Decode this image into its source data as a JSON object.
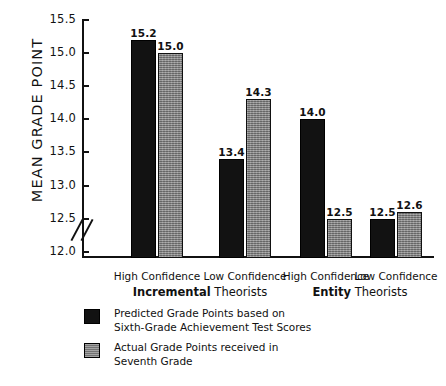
{
  "chart_data": {
    "type": "bar",
    "title": "",
    "xlabel": "",
    "ylabel": "MEAN GRADE POINT",
    "ylim": [
      12.0,
      15.5
    ],
    "ytick_labels": [
      "15.5",
      "15.0",
      "14.5",
      "14.0",
      "13.5",
      "13.0",
      "12.5",
      "12.0"
    ],
    "ytick_values": [
      15.5,
      15.0,
      14.5,
      14.0,
      13.5,
      13.0,
      12.5,
      12.0
    ],
    "axis_break": true,
    "grid": false,
    "legend_position": "bottom-left",
    "categories": [
      "High Confidence",
      "Low Confidence",
      "High Confidence",
      "Low Confidence"
    ],
    "group_labels": [
      {
        "bold": "Incremental",
        "plain": "Theorists"
      },
      {
        "bold": "Entity",
        "plain": "Theorists"
      }
    ],
    "series": [
      {
        "name": "Predicted Grade Points based on Sixth-Grade Achievement Test Scores",
        "color": "#121212",
        "values": [
          15.2,
          13.4,
          14.0,
          12.5
        ],
        "labels": [
          "15.2",
          "13.4",
          "14.0",
          "12.5"
        ]
      },
      {
        "name": "Actual Grade Points received in Seventh Grade",
        "color": "#8b8b8b",
        "values": [
          15.0,
          14.3,
          12.5,
          12.6
        ],
        "labels": [
          "15.0",
          "14.3",
          "12.5",
          "12.6"
        ]
      }
    ]
  },
  "legend": {
    "items": [
      {
        "swatch": "dark",
        "line1": "Predicted Grade Points based on",
        "line2": "Sixth-Grade Achievement Test Scores"
      },
      {
        "swatch": "gray",
        "line1": "Actual Grade Points received in",
        "line2": "Seventh Grade"
      }
    ]
  },
  "axis": {
    "break_symbol": "//"
  }
}
